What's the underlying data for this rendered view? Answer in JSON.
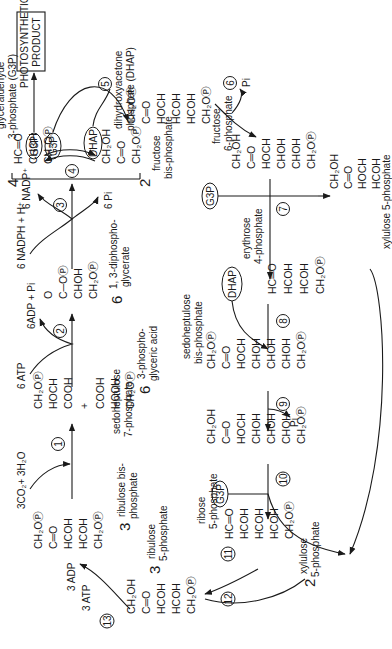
{
  "orientation": "rotated 90 degrees counter-clockwise",
  "product_box": {
    "text_line1": "PHOTOSYNTHETIC",
    "text_line2": "PRODUCT"
  },
  "compounds": {
    "rubp": {
      "count": "3",
      "name_line1": "ribulose bis-",
      "name_line2": "phosphate",
      "lines": [
        "CH₂OⓅ",
        "C═O",
        "HCOH",
        "HCOH",
        "CH₂OⓅ"
      ]
    },
    "pga": {
      "count": "6",
      "name_line1": "3-phospho-",
      "name_line2": "glyceric acid",
      "top": [
        "CH₂OⓅ",
        "HOCH",
        "COOH"
      ],
      "plus": "+",
      "bottom": [
        "COOH",
        "HCOH",
        "CH₂OⓅ"
      ]
    },
    "bpg": {
      "count": "6",
      "name_line1": "1, 3-diphospho-",
      "name_line2": "glycerate",
      "lines": [
        "O",
        "C─OⓅ",
        "CHOH",
        "CH₂OⓅ"
      ]
    },
    "g3p": {
      "count": "4",
      "name_line1": "glyceraldehyde",
      "name_line2": "3-phosphate (G3P)",
      "lines": [
        "HC═O",
        "CHOH",
        "CH₂OⓅ"
      ]
    },
    "dhap": {
      "count": "2",
      "name_line1": "dihydroxyacetone",
      "name_line2": "phosphate (DHAP)",
      "lines": [
        "CH₂OH",
        "C═O",
        "CH₂OⓅ"
      ]
    },
    "fbp": {
      "name_line1": "fructose",
      "name_line2": "bis-phosphate",
      "lines": [
        "CH₂OⓅ",
        "C═O",
        "HOCH",
        "HCOH",
        "HCOH",
        "CH₂OⓅ"
      ]
    },
    "f6p": {
      "name_line1": "fructose",
      "name_line2": "6-phosphate",
      "lines": [
        "CH₂OH",
        "C═O",
        "HOCH",
        "CHOH",
        "CHOH",
        "CH₂OⓅ"
      ]
    },
    "xu5p_a": {
      "name": "xylulose 5-phosphate",
      "lines": [
        "CH₂OH",
        "C═O",
        "HOCH",
        "HCOH",
        "CH₂OⓅ"
      ]
    },
    "e4p": {
      "name_line1": "erythrose",
      "name_line2": "4-phosphate",
      "lines": [
        "HC═O",
        "HCOH",
        "HCOH",
        "CH₂OⓅ"
      ]
    },
    "sbp": {
      "name_line1": "sedoheptulose",
      "name_line2": "bis-phosphate",
      "lines": [
        "CH₂OⓅ",
        "C═O",
        "HOCH",
        "CHOH",
        "CHOH",
        "CHOH",
        "CH₂OⓅ"
      ]
    },
    "s7p": {
      "name_line1": "sedoheptulose",
      "name_line2": "7-phosphate",
      "lines": [
        "CH₂OH",
        "C═O",
        "HOCH",
        "CHOH",
        "CHOH",
        "CHOH",
        "CH₂OⓅ"
      ]
    },
    "r5p": {
      "name_line1": "ribose",
      "name_line2": "5-phosphate",
      "lines": [
        "HC═O",
        "HCOH",
        "HCOH",
        "HCOH",
        "CH₂OⓅ"
      ]
    },
    "xu5p_b": {
      "count": "2",
      "name_line1": "xylulose",
      "name_line2": "5-phosphate"
    },
    "ru5p": {
      "count": "3",
      "name_line1": "ribulose",
      "name_line2": "5-phosphate",
      "lines": [
        "CH₂OH",
        "C═O",
        "HCOH",
        "HCOH",
        "CH₂OⓅ"
      ]
    }
  },
  "ovals": {
    "g3p_product": "G3P",
    "g3p_to_fbp": "G3P",
    "dhap_to_fbp": "DHAP",
    "g3p_step7": "G3P",
    "dhap_step8": "DHAP",
    "g3p_step10": "G3P"
  },
  "reagents": {
    "co2_water": "3CO₂+ 3H₂O",
    "atp6": "6 ATP",
    "adp6": "6ADP + Pi",
    "nadph": "6 NADPH + H⁺",
    "nadp": "6 NADP⁺",
    "pi6": "6 Pi",
    "pi_step6": "Pi",
    "pi_step9": "Pi",
    "adp3": "3 ADP",
    "atp3": "3 ATP"
  },
  "steps": [
    "1",
    "2",
    "3",
    "4",
    "5",
    "6",
    "7",
    "8",
    "9",
    "10",
    "11",
    "12",
    "13"
  ]
}
